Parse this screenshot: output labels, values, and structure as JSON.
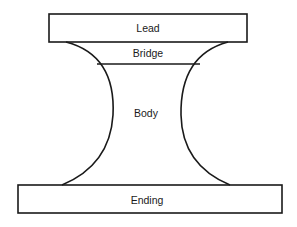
{
  "diagram": {
    "type": "structure-diagram",
    "sections": [
      {
        "id": "lead",
        "label": "Lead"
      },
      {
        "id": "bridge",
        "label": "Bridge"
      },
      {
        "id": "body",
        "label": "Body"
      },
      {
        "id": "ending",
        "label": "Ending"
      }
    ],
    "colors": {
      "stroke": "#1a1a1a",
      "background": "#ffffff"
    }
  }
}
